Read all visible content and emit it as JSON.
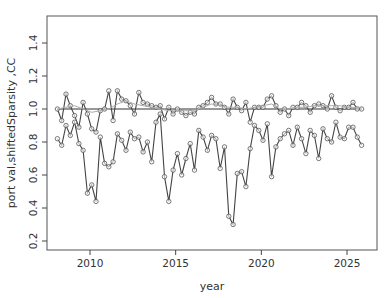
{
  "chart_data": {
    "type": "line",
    "title": "",
    "xlabel": "year",
    "ylabel": "port val,shiftedSparsity ,CC",
    "xlim": [
      2007.6,
      2026.8
    ],
    "ylim": [
      0.17,
      1.57
    ],
    "xticks": [
      2010,
      2015,
      2020,
      2025
    ],
    "yticks": [
      0.2,
      0.4,
      0.6,
      0.8,
      1.0,
      1.2,
      1.4
    ],
    "ytick_labels": [
      "0.2",
      "0.4",
      "0.6",
      "0.8",
      "1.0",
      "1.2",
      "1.4"
    ],
    "xtick_labels": [
      "2010",
      "2015",
      "2020",
      "2025"
    ],
    "grid": false,
    "legend": null,
    "reference_line": {
      "y": 1.0,
      "label": "baseline"
    },
    "series": [
      {
        "name": "upper",
        "marker": "circle",
        "x": [
          2008.1,
          2008.35,
          2008.6,
          2008.85,
          2009.1,
          2009.35,
          2009.6,
          2009.85,
          2010.1,
          2010.35,
          2010.6,
          2010.85,
          2011.1,
          2011.35,
          2011.6,
          2011.85,
          2012.1,
          2012.35,
          2012.6,
          2012.85,
          2013.1,
          2013.35,
          2013.6,
          2013.85,
          2014.1,
          2014.35,
          2014.6,
          2014.85,
          2015.1,
          2015.35,
          2015.6,
          2015.85,
          2016.1,
          2016.35,
          2016.6,
          2016.85,
          2017.1,
          2017.35,
          2017.6,
          2017.85,
          2018.1,
          2018.35,
          2018.6,
          2018.85,
          2019.1,
          2019.35,
          2019.6,
          2019.85,
          2020.1,
          2020.35,
          2020.6,
          2020.85,
          2021.1,
          2021.35,
          2021.6,
          2021.85,
          2022.1,
          2022.35,
          2022.6,
          2022.85,
          2023.1,
          2023.35,
          2023.6,
          2023.85,
          2024.1,
          2024.35,
          2024.6,
          2024.85,
          2025.1,
          2025.35,
          2025.6,
          2025.85
        ],
        "values": [
          1.0,
          0.93,
          1.09,
          1.02,
          0.96,
          0.89,
          1.04,
          0.97,
          0.88,
          0.86,
          0.99,
          1.0,
          1.11,
          0.93,
          1.11,
          1.06,
          1.05,
          1.02,
          0.97,
          1.1,
          1.04,
          1.03,
          1.02,
          1.01,
          1.02,
          0.94,
          1.01,
          0.97,
          1.0,
          0.98,
          0.96,
          0.98,
          0.97,
          1.01,
          1.02,
          1.04,
          1.07,
          1.03,
          1.03,
          1.01,
          0.97,
          1.06,
          1.01,
          0.99,
          1.04,
          0.92,
          1.01,
          1.01,
          1.01,
          1.06,
          1.08,
          1.02,
          0.98,
          1.0,
          0.96,
          1.01,
          1.01,
          1.04,
          1.02,
          0.98,
          1.02,
          1.03,
          1.02,
          1.0,
          1.08,
          1.01,
          0.99,
          1.01,
          1.01,
          1.04,
          1.0,
          1.0
        ]
      },
      {
        "name": "lower",
        "marker": "circle",
        "x": [
          2008.1,
          2008.35,
          2008.6,
          2008.85,
          2009.1,
          2009.35,
          2009.6,
          2009.85,
          2010.1,
          2010.35,
          2010.6,
          2010.85,
          2011.1,
          2011.35,
          2011.6,
          2011.85,
          2012.1,
          2012.35,
          2012.6,
          2012.85,
          2013.1,
          2013.35,
          2013.6,
          2013.85,
          2014.1,
          2014.35,
          2014.6,
          2014.85,
          2015.1,
          2015.35,
          2015.6,
          2015.85,
          2016.1,
          2016.35,
          2016.6,
          2016.85,
          2017.1,
          2017.35,
          2017.6,
          2017.85,
          2018.1,
          2018.35,
          2018.6,
          2018.85,
          2019.1,
          2019.35,
          2019.6,
          2019.85,
          2020.1,
          2020.35,
          2020.6,
          2020.85,
          2021.1,
          2021.35,
          2021.6,
          2021.85,
          2022.1,
          2022.35,
          2022.6,
          2022.85,
          2023.1,
          2023.35,
          2023.6,
          2023.85,
          2024.1,
          2024.35,
          2024.6,
          2024.85,
          2025.1,
          2025.35,
          2025.6,
          2025.85
        ],
        "values": [
          0.82,
          0.78,
          0.9,
          0.84,
          0.92,
          0.79,
          0.75,
          0.49,
          0.54,
          0.44,
          0.83,
          0.67,
          0.65,
          0.68,
          0.85,
          0.81,
          0.75,
          0.86,
          0.82,
          0.83,
          0.74,
          0.8,
          0.68,
          0.92,
          0.97,
          0.59,
          0.44,
          0.63,
          0.73,
          0.6,
          0.7,
          0.79,
          0.63,
          0.87,
          0.83,
          0.75,
          0.84,
          0.82,
          0.64,
          0.77,
          0.35,
          0.3,
          0.61,
          0.62,
          0.53,
          0.76,
          0.9,
          0.87,
          0.81,
          0.91,
          0.59,
          0.77,
          0.82,
          0.85,
          0.87,
          0.78,
          0.89,
          0.82,
          0.73,
          0.87,
          0.84,
          0.7,
          0.88,
          0.82,
          0.8,
          0.92,
          0.83,
          0.82,
          0.89,
          0.89,
          0.83,
          0.78
        ]
      },
      {
        "name": "smooth",
        "marker": "none",
        "x": [
          2008.1,
          2008.6,
          2009.1,
          2009.6,
          2010.1,
          2010.6,
          2011.1,
          2011.6,
          2012.1,
          2012.6,
          2013.1,
          2013.6,
          2014.1,
          2014.6,
          2015.1,
          2015.6,
          2016.1,
          2016.6,
          2017.1,
          2017.6,
          2018.1,
          2018.6,
          2019.1,
          2019.6,
          2020.1,
          2020.6,
          2021.1,
          2021.6,
          2022.1,
          2022.6,
          2023.1,
          2023.6,
          2024.1,
          2024.6,
          2025.1,
          2025.85
        ],
        "values": [
          1.0,
          1.01,
          1.02,
          1.0,
          0.98,
          0.99,
          1.0,
          1.03,
          1.05,
          1.03,
          1.02,
          1.01,
          1.0,
          0.99,
          0.99,
          0.99,
          0.99,
          1.01,
          1.03,
          1.02,
          1.01,
          1.01,
          1.0,
          1.01,
          1.02,
          1.03,
          1.0,
          1.0,
          1.01,
          1.01,
          1.02,
          1.02,
          1.02,
          1.02,
          1.01,
          1.01
        ]
      }
    ]
  },
  "colors": {
    "line": "#444444",
    "marker": "#555555",
    "smooth": "#aaaaaa",
    "axis": "#444444",
    "text": "#333333"
  }
}
